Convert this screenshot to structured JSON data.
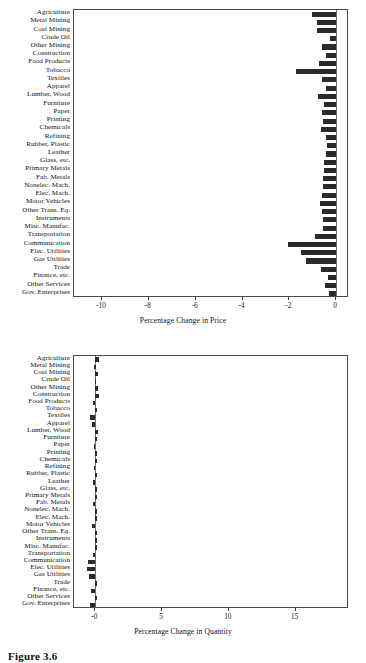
{
  "figure": {
    "caption": "Figure 3.6"
  },
  "categories": [
    "Agriculture",
    "Metal Mining",
    "Coal Mining",
    "Crude Oil",
    "Other Mining",
    "Construction",
    "Food Products",
    "Tobacco",
    "Textiles",
    "Apparel",
    "Lumber, Wood",
    "Furniture",
    "Paper",
    "Printing",
    "Chemicals",
    "Refining",
    "Rubber, Plastic",
    "Leather",
    "Glass, etc.",
    "Primary Metals",
    "Fab. Metals",
    "Nonelec. Mach.",
    "Elec. Mach.",
    "Motor Vehicles",
    "Other Trans. Eq.",
    "Instruments",
    "Misc. Manufac.",
    "Transportation",
    "Communication",
    "Elec. Utilities",
    "Gas Utilities",
    "Trade",
    "Finance, etc.",
    "Other Services",
    "Gov. Enterprises"
  ],
  "chart_data": [
    {
      "type": "bar",
      "orientation": "horizontal",
      "title": "",
      "xlabel": "Percentage Change in Price",
      "ylabel": "",
      "xlim": [
        -11.2,
        0.55
      ],
      "xticks": [
        -10,
        -8,
        -6,
        -4,
        -2,
        0
      ],
      "xticklabels": [
        "-10",
        "-8",
        "-6",
        "-4",
        "-2",
        "0"
      ],
      "grid": false,
      "bar_color": "#2b2b2b",
      "categories": [
        "Agriculture",
        "Metal Mining",
        "Coal Mining",
        "Crude Oil",
        "Other Mining",
        "Construction",
        "Food Products",
        "Tobacco",
        "Textiles",
        "Apparel",
        "Lumber, Wood",
        "Furniture",
        "Paper",
        "Printing",
        "Chemicals",
        "Refining",
        "Rubber, Plastic",
        "Leather",
        "Glass, etc.",
        "Primary Metals",
        "Fab. Metals",
        "Nonelec. Mach.",
        "Elec. Mach.",
        "Motor Vehicles",
        "Other Trans. Eq.",
        "Instruments",
        "Misc. Manufac.",
        "Transportation",
        "Communication",
        "Elec. Utilities",
        "Gas Utilities",
        "Trade",
        "Finance, etc.",
        "Other Services",
        "Gov. Enterprises"
      ],
      "values": [
        -1.05,
        -0.8,
        -0.8,
        -0.25,
        -0.6,
        -0.45,
        -0.75,
        -1.7,
        -0.6,
        -0.45,
        -0.78,
        -0.52,
        -0.62,
        -0.58,
        -0.65,
        -0.42,
        -0.38,
        -0.45,
        -0.5,
        -0.52,
        -0.55,
        -0.58,
        -0.62,
        -0.7,
        -0.6,
        -0.58,
        -0.55,
        -0.9,
        -2.05,
        -1.5,
        -1.3,
        -0.65,
        -0.35,
        -0.48,
        -0.3
      ]
    },
    {
      "type": "bar",
      "orientation": "horizontal",
      "title": "",
      "xlabel": "Percentage Change in Quantity",
      "ylabel": "",
      "xlim": [
        -1.6,
        19.0
      ],
      "xticks": [
        0,
        5,
        10,
        15
      ],
      "xticklabels": [
        "-0",
        "5",
        "10",
        "15"
      ],
      "grid": false,
      "bar_color": "#2b2b2b",
      "categories": [
        "Agriculture",
        "Metal Mining",
        "Coal Mining",
        "Crude Oil",
        "Other Mining",
        "Construction",
        "Food Products",
        "Tobacco",
        "Textiles",
        "Apparel",
        "Lumber, Wood",
        "Furniture",
        "Paper",
        "Printing",
        "Chemicals",
        "Refining",
        "Rubber, Plastic",
        "Leather",
        "Glass, etc.",
        "Primary Metals",
        "Fab. Metals",
        "Nonelec. Mach.",
        "Elec. Mach.",
        "Motor Vehicles",
        "Other Trans. Eq.",
        "Instruments",
        "Misc. Manufac.",
        "Transportation",
        "Communication",
        "Elec. Utilities",
        "Gas Utilities",
        "Trade",
        "Finance, etc.",
        "Other Services",
        "Gov. Enterprises"
      ],
      "values": [
        0.3,
        -0.08,
        0.18,
        -0.05,
        0.2,
        0.3,
        -0.2,
        0.12,
        -0.4,
        -0.28,
        0.22,
        0.05,
        -0.12,
        0.06,
        0.05,
        -0.1,
        0.06,
        -0.18,
        0.06,
        0.05,
        -0.14,
        0.05,
        0.06,
        -0.22,
        0.05,
        0.06,
        0.05,
        -0.18,
        -0.55,
        -0.6,
        -0.45,
        0.05,
        -0.3,
        0.06,
        -0.38
      ]
    }
  ]
}
